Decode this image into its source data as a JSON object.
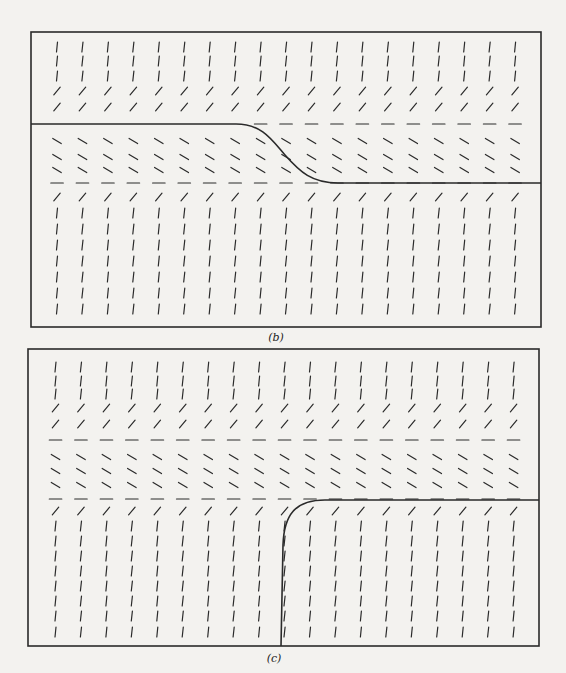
{
  "figure": {
    "kind": "direction field (slope field) of an autonomous ODE with two equilibrium solutions",
    "ink_color": "#2a2a2a",
    "background_color": "#f3f2ef"
  },
  "panels": [
    {
      "id": "b",
      "caption": "(b)",
      "columns": 19,
      "row_slopes": [
        "steep",
        "steep",
        "steep",
        "positive",
        "positive",
        "equilibrium",
        "negative",
        "negative",
        "negative",
        "equilibrium",
        "positive",
        "steep",
        "steep",
        "steep",
        "steep",
        "steep",
        "steep",
        "steep"
      ],
      "solution_curve": "follows upper equilibrium on the left, descends through the middle band, then follows lower equilibrium on the right"
    },
    {
      "id": "c",
      "caption": "(c)",
      "columns": 19,
      "row_slopes": [
        "steep",
        "steep",
        "steep",
        "positive",
        "positive",
        "equilibrium",
        "negative",
        "negative",
        "negative",
        "equilibrium",
        "positive",
        "steep",
        "steep",
        "steep",
        "steep",
        "steep",
        "steep",
        "steep",
        "steep"
      ],
      "solution_curve": "rises steeply from the bottom near the center and levels off onto the lower equilibrium on the right"
    }
  ]
}
